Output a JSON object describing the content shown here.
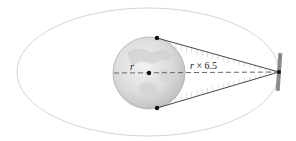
{
  "diagram": {
    "labels": {
      "earth_radius": "r",
      "satellite_distance_var": "r",
      "satellite_distance_rest": " × 6.5"
    },
    "distance_multiplier": 6.5,
    "colors": {
      "orbit": "#c8c8c8",
      "cone_line": "#333333",
      "hatch": "#cfcfcf",
      "dashed_axis": "#666666",
      "points": "#111111",
      "satellite_panel": "#8a8a8a",
      "earth_light": "#ececec",
      "earth_dark": "#b9b9b9"
    }
  }
}
